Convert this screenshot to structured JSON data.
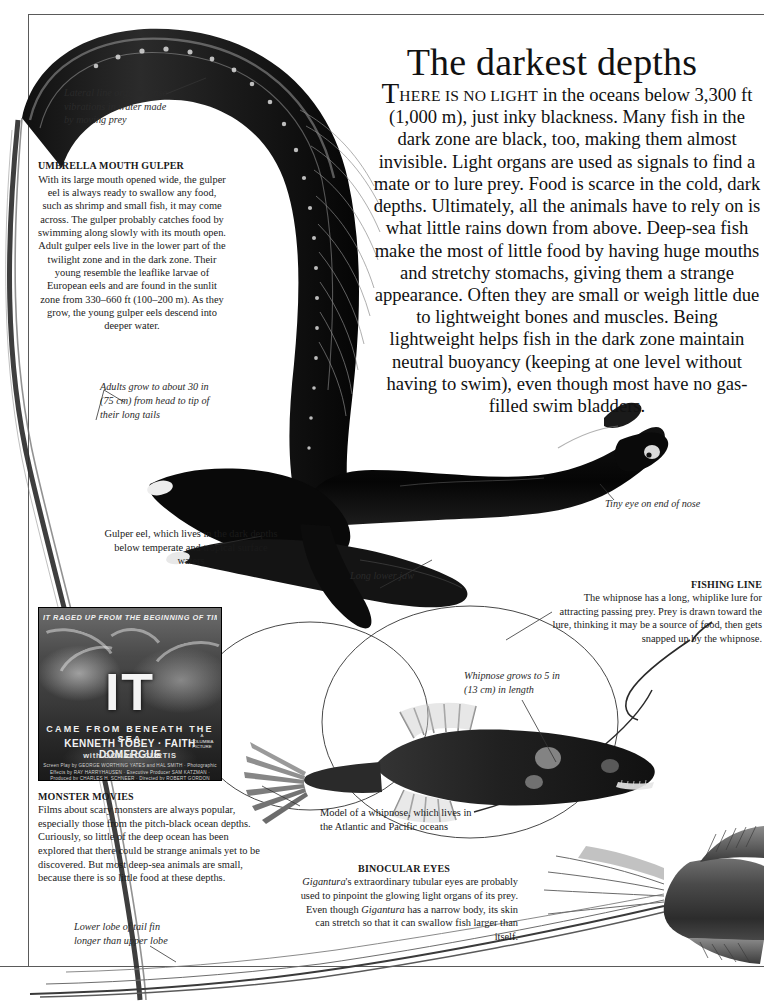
{
  "page": {
    "title": "The darkest depths",
    "intro": {
      "dropcap": "T",
      "smallcaps": "HERE IS NO LIGHT",
      "body": " in the oceans below 3,300 ft (1,000 m), just inky blackness. Many fish in the dark zone are black, too, making them almost invisible. Light organs are used as signals to find a mate or to lure prey. Food is scarce in the cold, dark depths. Ultimately, all the animals have to rely on is what little rains down from above. Deep-sea fish make the most of little food by having huge mouths and stretchy stomachs, giving them a strange appearance. Often they are small or weigh little due to lightweight bones and muscles. Being lightweight helps fish in the dark zone maintain neutral buoyancy (keeping at one level without having to swim), even though most have no gas-filled swim bladders."
    }
  },
  "annotations": {
    "lateral_line": "Lateral line organs sense vibrations in water made by moving prey",
    "adults_grow": "Adults grow to about 30 in (75 cm) from head to tip of their long tails",
    "gulper_caption": "Gulper eel, which lives in the dark depths below temperate and tropical surface waters",
    "tiny_eye": "Tiny eye on end of nose",
    "long_lower_jaw": "Long lower jaw",
    "whipnose_grows": "Whipnose grows to 5 in (13 cm) in length",
    "whipnose_model": "Model of a whipnose, which lives in the Atlantic and Pacific oceans",
    "lower_lobe": "Lower lobe of tail fin longer than upper lobe"
  },
  "sections": {
    "umbrella_mouth_gulper": {
      "heading": "UMBRELLA MOUTH GULPER",
      "body": "With its large mouth opened wide, the gulper eel is always ready to swallow any food, such as shrimp and small fish, it may come across. The gulper probably catches food by swimming along slowly with its mouth open. Adult gulper eels live in the lower part of the twilight zone and in the dark zone. Their young resemble the leaflike larvae of European eels and are found in the sunlit zone from 330–660 ft (100–200 m). As they grow, the young gulper eels descend into deeper water."
    },
    "fishing_line": {
      "heading": "FISHING LINE",
      "body": "The whipnose has a long, whiplike lure for attracting passing prey. Prey is drawn toward the lure, thinking it may be a source of food, then gets snapped up by the whipnose."
    },
    "monster_movies": {
      "heading": "MONSTER MOVIES",
      "body": "Films about scary monsters are always popular, especially those from the pitch-black ocean depths. Curiously, so little of the deep ocean has been explored that there could be strange animals yet to be discovered. But most deep-sea animals are small, because there is so little food at these depths."
    },
    "binocular_eyes": {
      "heading": "BINOCULAR EYES",
      "part1": "Gigantura",
      "part2": "'s extraordinary tubular eyes are probably used to pinpoint the glowing light organs of its prey. Even though ",
      "part3": "Gigantura",
      "part4": " has a narrow body, its skin can stretch so that it can swallow fish larger than itself."
    }
  },
  "movie_poster": {
    "tagline": "IT RAGED UP FROM THE BEGINNING OF TIME",
    "title": "IT",
    "subtitle": "CAME FROM BENEATH THE SEA",
    "stars": "KENNETH TOBEY · FAITH DOMERGUE",
    "costars": "with DONALD CURTIS",
    "credits": "Screen Play by GEORGE WORTHING YATES and HAL SMITH · Photographic Effects by RAY HARRYHAUSEN · Executive Producer SAM KATZMAN · Produced by CHARLES H. SCHNEER · Directed by ROBERT GORDON",
    "studio": "A COLUMBIA PICTURE"
  },
  "colors": {
    "ink": "#111111",
    "rule": "#5a5a5a",
    "caption": "#1a1a1a",
    "italic": "#2a2a2a",
    "paper": "#ffffff"
  }
}
